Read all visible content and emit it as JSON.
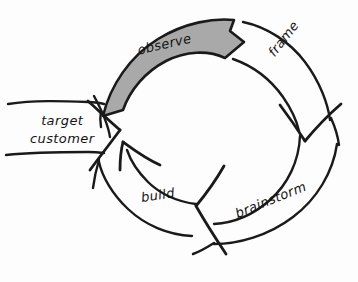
{
  "diagram": {
    "style": "hand-drawn sketch",
    "background_color": "#fdfdfd",
    "ink_color": "#1a1a1a",
    "highlight_fill_color": "#a9a9a9"
  },
  "cycle": {
    "direction": "clockwise",
    "stages": [
      {
        "id": "observe",
        "label": "observe",
        "position": "top",
        "highlighted": true,
        "fill": "#a9a9a9"
      },
      {
        "id": "frame",
        "label": "frame",
        "position": "right-top",
        "highlighted": false,
        "fill": "none"
      },
      {
        "id": "brainstorm",
        "label": "brainstorm",
        "position": "right-bottom",
        "highlighted": false,
        "fill": "none"
      },
      {
        "id": "build",
        "label": "build",
        "position": "bottom-left",
        "highlighted": false,
        "fill": "none"
      }
    ]
  },
  "input_banner": {
    "id": "target-customer",
    "label_line_1": "target",
    "label_line_2": "customer",
    "shape": "banner-arrow",
    "points_to": "cycle",
    "position": "left"
  }
}
